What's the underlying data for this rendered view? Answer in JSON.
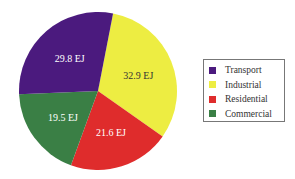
{
  "chart_data": {
    "type": "pie",
    "title": "",
    "unit": "EJ",
    "categories": [
      "Transport",
      "Industrial",
      "Residential",
      "Commercial"
    ],
    "values": [
      29.8,
      32.9,
      21.6,
      19.5
    ],
    "labels": [
      "29.8 EJ",
      "32.9 EJ",
      "21.6 EJ",
      "19.5 EJ"
    ],
    "colors": [
      "#4b1a7e",
      "#eded42",
      "#df2c2c",
      "#3a7f45"
    ],
    "legend_position": "right"
  },
  "legend": {
    "items": [
      {
        "label": "Transport",
        "color": "#4b1a7e"
      },
      {
        "label": "Industrial",
        "color": "#eded42"
      },
      {
        "label": "Residential",
        "color": "#df2c2c"
      },
      {
        "label": "Commercial",
        "color": "#3a7f45"
      }
    ]
  }
}
